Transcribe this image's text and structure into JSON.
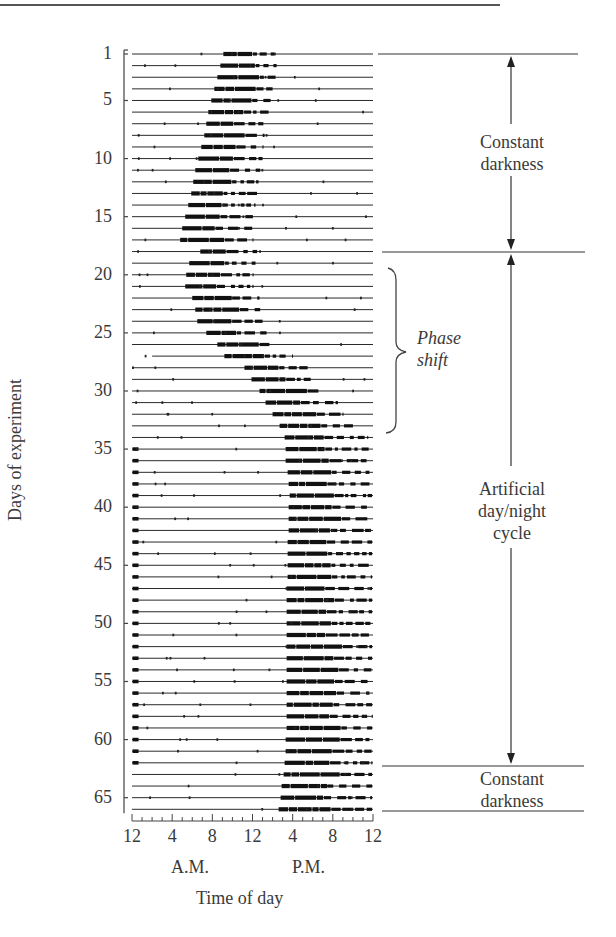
{
  "chart_data": {
    "type": "heatmap",
    "subtype": "actogram",
    "title": "",
    "xlabel": "Time of day",
    "ylabel": "Days of experiment",
    "x_ticks": [
      "12",
      "4",
      "8",
      "12",
      "4",
      "8",
      "12"
    ],
    "x_tick_hours": [
      0,
      4,
      8,
      12,
      16,
      20,
      24
    ],
    "x_period_labels": [
      "A.M.",
      "P.M."
    ],
    "y_ticks": [
      1,
      5,
      10,
      15,
      20,
      25,
      30,
      35,
      40,
      45,
      50,
      55,
      60,
      65
    ],
    "ylim": [
      1,
      66
    ],
    "xlim": [
      0,
      24
    ],
    "annotations": [
      {
        "label": "Constant darkness",
        "days": [
          1,
          18
        ]
      },
      {
        "label": "Artificial day/night cycle",
        "days": [
          18,
          62
        ]
      },
      {
        "label": "Constant darkness",
        "days": [
          62,
          66
        ]
      },
      {
        "label": "Phase shift",
        "style": "italic",
        "days": [
          19,
          33
        ]
      }
    ],
    "activity_onset_hours": {
      "days": [
        1,
        2,
        3,
        4,
        5,
        6,
        7,
        8,
        9,
        10,
        11,
        12,
        13,
        14,
        15,
        16,
        17,
        18,
        19,
        20,
        21,
        22,
        23,
        24,
        25,
        26,
        27,
        28,
        29,
        30,
        31,
        32,
        33,
        34,
        35,
        36,
        37,
        38,
        39,
        40,
        41,
        42,
        43,
        44,
        45,
        46,
        47,
        48,
        49,
        50,
        51,
        52,
        53,
        54,
        55,
        56,
        57,
        58,
        59,
        60,
        61,
        62,
        63,
        64,
        65,
        66
      ],
      "onset": [
        9.1,
        8.8,
        8.5,
        8.2,
        7.9,
        7.6,
        7.4,
        7.2,
        6.9,
        6.6,
        6.3,
        6.1,
        5.9,
        5.6,
        5.3,
        5.0,
        4.8,
        6.8,
        5.7,
        5.4,
        5.3,
        6.0,
        6.3,
        6.5,
        7.4,
        8.5,
        9.2,
        11.2,
        11.9,
        12.7,
        13.3,
        14.0,
        14.7,
        15.2,
        15.3,
        15.3,
        15.5,
        15.6,
        15.7,
        15.6,
        15.6,
        15.6,
        15.5,
        15.5,
        15.5,
        15.5,
        15.4,
        15.4,
        15.4,
        15.4,
        15.4,
        15.4,
        15.4,
        15.4,
        15.4,
        15.4,
        15.4,
        15.4,
        15.4,
        15.3,
        15.3,
        15.2,
        15.1,
        14.9,
        14.8,
        14.6
      ],
      "offset": [
        14.5,
        14.4,
        14.3,
        14.0,
        13.8,
        13.6,
        13.4,
        13.2,
        13.1,
        13.0,
        12.8,
        12.6,
        12.5,
        12.3,
        12.2,
        12.0,
        12.0,
        12.5,
        12.3,
        12.1,
        12.1,
        12.7,
        12.9,
        13.0,
        13.4,
        14.0,
        16.0,
        17.5,
        18.2,
        19.0,
        20.5,
        21.0,
        22.0,
        23.5,
        23.8,
        23.7,
        23.9,
        23.9,
        23.9,
        23.9,
        23.9,
        23.9,
        23.9,
        23.9,
        23.9,
        23.9,
        23.9,
        23.9,
        23.9,
        23.9,
        23.9,
        23.9,
        23.9,
        23.9,
        23.9,
        23.9,
        23.9,
        23.9,
        23.9,
        23.9,
        23.9,
        23.9,
        23.9,
        23.9,
        23.9,
        23.9
      ]
    },
    "grid": false,
    "legend": null
  },
  "labels": {
    "ylabel": "Days of experiment",
    "xlabel": "Time of day",
    "am": "A.M.",
    "pm": "P.M.",
    "cd1_line1": "Constant",
    "cd1_line2": "darkness",
    "adn_line1": "Artificial",
    "adn_line2": "day/night",
    "adn_line3": "cycle",
    "cd2_line1": "Constant",
    "cd2_line2": "darkness",
    "phase_line1": "Phase",
    "phase_line2": "shift"
  }
}
